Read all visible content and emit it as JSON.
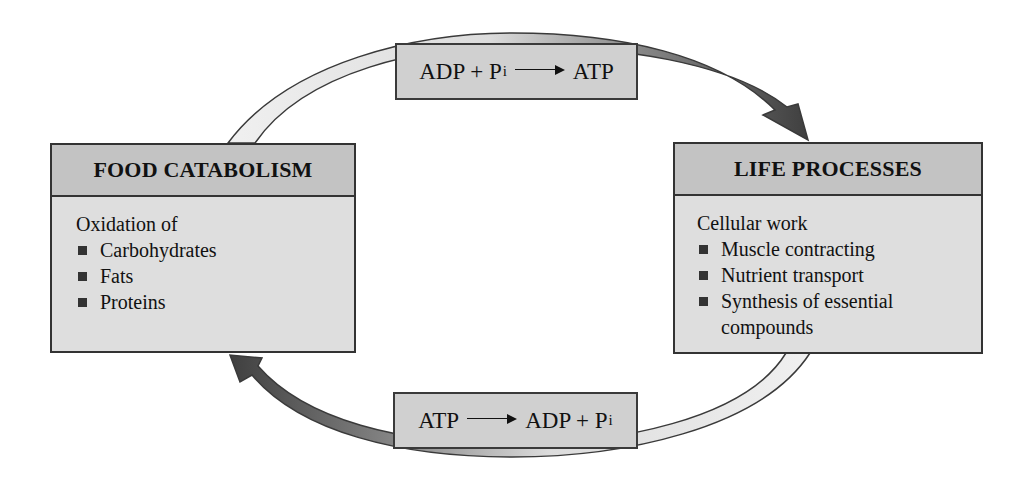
{
  "diagram": {
    "type": "cycle",
    "reactions": {
      "top": {
        "left_side": "ADP + P",
        "left_subscript": "i",
        "arrow": "→",
        "right_side": "ATP"
      },
      "bottom": {
        "left_side": "ATP",
        "arrow": "→",
        "right_side": "ADP + P",
        "right_subscript": "i"
      }
    },
    "panels": {
      "left": {
        "title": "FOOD CATABOLISM",
        "intro": "Oxidation of",
        "items": [
          "Carbohydrates",
          "Fats",
          "Proteins"
        ]
      },
      "right": {
        "title": "LIFE PROCESSES",
        "intro": "Cellular work",
        "items": [
          "Muscle contracting",
          "Nutrient transport",
          "Synthesis of essential compounds"
        ]
      }
    },
    "arrows": [
      {
        "from": "FOOD CATABOLISM",
        "to": "LIFE PROCESSES",
        "via": "ADP + Pi → ATP",
        "direction": "clockwise-top"
      },
      {
        "from": "LIFE PROCESSES",
        "to": "FOOD CATABOLISM",
        "via": "ATP → ADP + Pi",
        "direction": "clockwise-bottom"
      }
    ],
    "colors": {
      "arc_light": "#ececec",
      "arc_dark": "#4a4a4a",
      "box_fill": "#d0d0d0",
      "panel_header": "#c3c3c3",
      "panel_body": "#dedede",
      "outline": "#333333"
    }
  }
}
